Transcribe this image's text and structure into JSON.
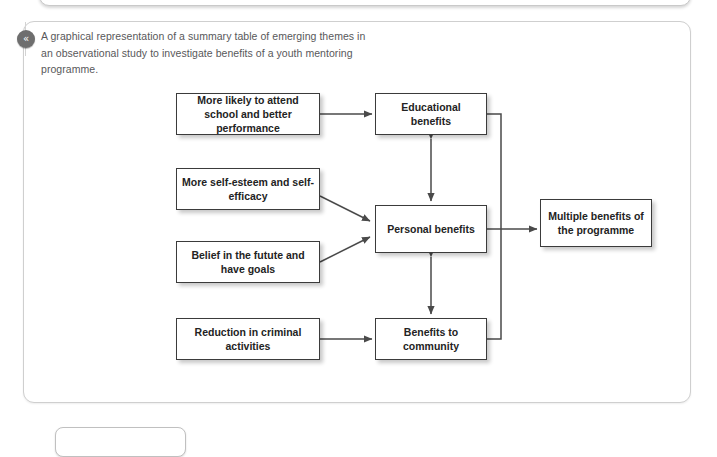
{
  "page": {
    "background_color": "#ffffff",
    "card_border_color": "#cfcfcf"
  },
  "badge": {
    "icon": "double-chevron-left-icon",
    "glyph": "«",
    "color": "#6e6e6e"
  },
  "caption": {
    "text": "A graphical representation of a summary table of emerging themes in an observational study to investigate benefits of a youth mentoring programme."
  },
  "diagram": {
    "node_border_color": "#3b3b3b",
    "node_fill_color": "#ffffff",
    "connector_color": "#4a4a4a",
    "nodes": {
      "school": "More likely to attend school and better performance",
      "esteem": "More self-esteem and self-efficacy",
      "belief": "Belief in the futute and have goals",
      "reduction": "Reduction in criminal activities",
      "educational": "Educational benefits",
      "personal": "Personal benefits",
      "community": "Benefits to community",
      "multiple": "Multiple benefits of the programme"
    },
    "connections": [
      {
        "from": "school",
        "to": "educational",
        "style": "arrow-right"
      },
      {
        "from": "esteem",
        "to": "personal",
        "style": "arrow-diagonal-down-right"
      },
      {
        "from": "belief",
        "to": "personal",
        "style": "arrow-diagonal-up-right"
      },
      {
        "from": "reduction",
        "to": "community",
        "style": "arrow-right"
      },
      {
        "from": "educational",
        "to": "personal",
        "style": "double-arrow-vertical"
      },
      {
        "from": "personal",
        "to": "community",
        "style": "double-arrow-vertical"
      },
      {
        "from": "educational",
        "to": "multiple",
        "style": "bracket-join-right"
      },
      {
        "from": "personal",
        "to": "multiple",
        "style": "bracket-join-right"
      },
      {
        "from": "community",
        "to": "multiple",
        "style": "bracket-join-right"
      }
    ]
  }
}
